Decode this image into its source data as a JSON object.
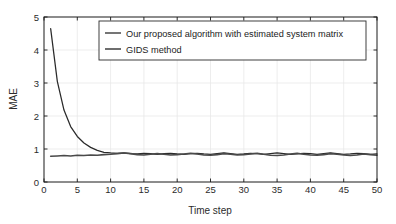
{
  "chart_data": {
    "type": "line",
    "title": "",
    "xlabel": "Time step",
    "ylabel": "MAE",
    "xlim": [
      0,
      50
    ],
    "ylim": [
      0,
      5
    ],
    "xticks": [
      0,
      5,
      10,
      15,
      20,
      25,
      30,
      35,
      40,
      45,
      50
    ],
    "yticks": [
      0,
      1,
      2,
      3,
      4,
      5
    ],
    "xtick_labels": [
      "0",
      "5",
      "10",
      "15",
      "20",
      "25",
      "30",
      "35",
      "40",
      "45",
      "50"
    ],
    "ytick_labels": [
      "0",
      "1",
      "2",
      "3",
      "4",
      "5"
    ],
    "grid": true,
    "grid_color": "#e8e8e8",
    "legend_position": "top-center",
    "x": [
      1,
      2,
      3,
      4,
      5,
      6,
      7,
      8,
      9,
      10,
      11,
      12,
      13,
      14,
      15,
      16,
      17,
      18,
      19,
      20,
      21,
      22,
      23,
      24,
      25,
      26,
      27,
      28,
      29,
      30,
      31,
      32,
      33,
      34,
      35,
      36,
      37,
      38,
      39,
      40,
      41,
      42,
      43,
      44,
      45,
      46,
      47,
      48,
      49,
      50
    ],
    "series": [
      {
        "name": "Our proposed algorithm with estimated system matrix",
        "color": "#2a2a2a",
        "values": [
          4.65,
          3.05,
          2.18,
          1.68,
          1.38,
          1.18,
          1.05,
          0.96,
          0.9,
          0.88,
          0.87,
          0.88,
          0.86,
          0.85,
          0.87,
          0.86,
          0.84,
          0.86,
          0.87,
          0.85,
          0.84,
          0.86,
          0.87,
          0.85,
          0.84,
          0.86,
          0.88,
          0.86,
          0.84,
          0.85,
          0.87,
          0.86,
          0.84,
          0.86,
          0.88,
          0.86,
          0.84,
          0.85,
          0.87,
          0.86,
          0.84,
          0.86,
          0.88,
          0.86,
          0.84,
          0.85,
          0.87,
          0.86,
          0.84,
          0.85
        ]
      },
      {
        "name": "GIDS method",
        "color": "#4a4a4a",
        "values": [
          0.78,
          0.79,
          0.8,
          0.79,
          0.81,
          0.8,
          0.82,
          0.81,
          0.83,
          0.84,
          0.86,
          0.88,
          0.86,
          0.83,
          0.82,
          0.84,
          0.86,
          0.84,
          0.82,
          0.83,
          0.85,
          0.87,
          0.85,
          0.82,
          0.81,
          0.83,
          0.86,
          0.84,
          0.82,
          0.83,
          0.85,
          0.87,
          0.84,
          0.81,
          0.8,
          0.82,
          0.85,
          0.87,
          0.84,
          0.82,
          0.81,
          0.83,
          0.86,
          0.84,
          0.82,
          0.8,
          0.82,
          0.85,
          0.83,
          0.81
        ]
      }
    ]
  },
  "legend": {
    "entries": [
      {
        "label": "Our proposed algorithm with estimated system matrix"
      },
      {
        "label": "GIDS method"
      }
    ]
  },
  "axes": {
    "x_title": "Time step",
    "y_title": "MAE"
  }
}
